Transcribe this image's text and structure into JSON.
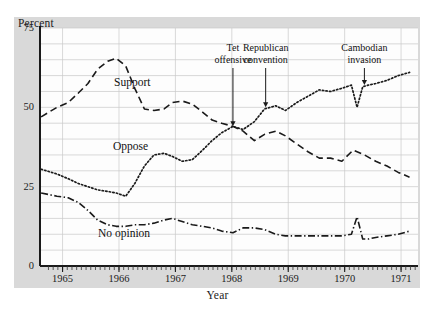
{
  "figure": {
    "background_color": "#d9d9d9",
    "plot_background_color": "#fdfdfd",
    "ink_color": "#1a1a1a",
    "grid_color": "#c8c8c8"
  },
  "axes": {
    "y_title": "Percent",
    "x_title": "Year",
    "y_ticks": [
      "75",
      "50",
      "25",
      "0"
    ],
    "y_tick_values": [
      75,
      50,
      25,
      0
    ],
    "x_ticks": [
      "1965",
      "1966",
      "1967",
      "1968",
      "1969",
      "1970",
      "1971"
    ],
    "x_tick_values": [
      1965,
      1966,
      1967,
      1968,
      1969,
      1970,
      1971
    ]
  },
  "series_labels": {
    "support": "Support",
    "oppose": "Oppose",
    "no_opinion": "No opinion"
  },
  "annotations": [
    {
      "id": "tet",
      "line1": "Tet",
      "line2": "offensive",
      "x_value": 1968.02,
      "y_value": 44
    },
    {
      "id": "republican",
      "line1": "Republican",
      "line2": "convention",
      "x_value": 1968.6,
      "y_value": 50
    },
    {
      "id": "cambodian",
      "line1": "Cambodian",
      "line2": "invasion",
      "x_value": 1970.35,
      "y_value": 57
    }
  ],
  "chart_data": {
    "type": "line",
    "title": "",
    "subtitle": "",
    "xlabel": "Year",
    "ylabel": "Percent",
    "xlim": [
      1964.6,
      1971.3
    ],
    "ylim": [
      0,
      75
    ],
    "grid": true,
    "legend": "inline-labels",
    "y_gridline_step": 5,
    "x_gridline_step": 1,
    "series": [
      {
        "name": "Support",
        "style": "dashed",
        "x": [
          1964.62,
          1964.9,
          1965.1,
          1965.28,
          1965.45,
          1965.62,
          1965.8,
          1965.95,
          1966.12,
          1966.28,
          1966.45,
          1966.62,
          1966.8,
          1966.95,
          1967.12,
          1967.3,
          1967.48,
          1967.65,
          1967.82,
          1968.02,
          1968.2,
          1968.4,
          1968.58,
          1968.78,
          1968.95,
          1969.15,
          1969.35,
          1969.55,
          1969.75,
          1969.95,
          1970.15,
          1970.35,
          1970.55,
          1970.75,
          1970.95,
          1971.15
        ],
        "y": [
          47.0,
          50.0,
          51.5,
          54.5,
          57.5,
          62.0,
          64.5,
          65.5,
          63.0,
          56.0,
          49.5,
          49.0,
          49.5,
          51.5,
          52.0,
          51.0,
          48.5,
          46.0,
          45.0,
          44.0,
          42.5,
          39.5,
          41.5,
          42.5,
          41.0,
          38.5,
          36.0,
          34.0,
          34.0,
          33.0,
          36.5,
          35.0,
          33.0,
          31.5,
          29.5,
          28.0
        ]
      },
      {
        "name": "Oppose",
        "style": "dotted",
        "x": [
          1964.62,
          1964.9,
          1965.1,
          1965.28,
          1965.45,
          1965.62,
          1965.8,
          1965.95,
          1966.12,
          1966.28,
          1966.45,
          1966.62,
          1966.8,
          1966.95,
          1967.12,
          1967.3,
          1967.48,
          1967.65,
          1967.82,
          1968.02,
          1968.2,
          1968.4,
          1968.58,
          1968.78,
          1968.95,
          1969.15,
          1969.35,
          1969.55,
          1969.75,
          1969.95,
          1970.12,
          1970.22,
          1970.32,
          1970.42,
          1970.55,
          1970.75,
          1970.95,
          1971.15
        ],
        "y": [
          30.5,
          29.0,
          27.5,
          26.0,
          25.0,
          24.0,
          23.5,
          23.0,
          22.0,
          26.0,
          31.5,
          35.0,
          35.5,
          34.5,
          33.0,
          33.5,
          36.5,
          39.5,
          42.0,
          44.0,
          43.0,
          45.5,
          49.5,
          50.5,
          49.0,
          51.5,
          53.5,
          55.5,
          55.0,
          56.0,
          57.0,
          50.0,
          56.5,
          57.0,
          57.5,
          58.5,
          60.0,
          61.0
        ]
      },
      {
        "name": "No opinion",
        "style": "dash-dot",
        "x": [
          1964.62,
          1964.9,
          1965.1,
          1965.28,
          1965.45,
          1965.62,
          1965.8,
          1965.95,
          1966.12,
          1966.28,
          1966.45,
          1966.62,
          1966.8,
          1966.95,
          1967.12,
          1967.3,
          1967.48,
          1967.65,
          1967.82,
          1968.02,
          1968.2,
          1968.4,
          1968.58,
          1968.78,
          1968.95,
          1969.15,
          1969.35,
          1969.55,
          1969.75,
          1969.95,
          1970.12,
          1970.22,
          1970.32,
          1970.42,
          1970.55,
          1970.75,
          1970.95,
          1971.15
        ],
        "y": [
          23.0,
          22.0,
          21.5,
          20.0,
          17.5,
          14.5,
          13.0,
          12.5,
          12.5,
          13.0,
          13.0,
          13.5,
          14.5,
          15.0,
          14.0,
          13.0,
          12.5,
          12.0,
          11.0,
          10.5,
          12.0,
          12.0,
          11.5,
          10.0,
          9.5,
          9.5,
          9.5,
          9.5,
          9.5,
          9.5,
          10.0,
          15.5,
          8.5,
          8.5,
          9.0,
          9.5,
          10.0,
          11.0
        ]
      }
    ]
  }
}
